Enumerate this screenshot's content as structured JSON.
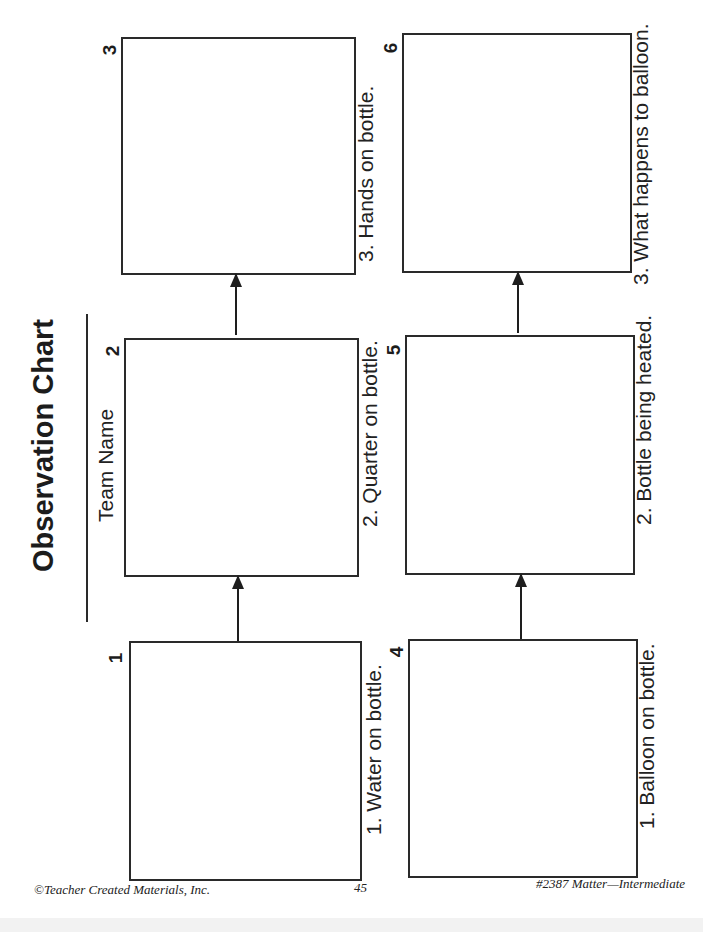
{
  "header": {
    "title": "Observation Chart",
    "team_label": "Team Name"
  },
  "panels": [
    {
      "number": "1",
      "caption": "1.  Water on bottle."
    },
    {
      "number": "2",
      "caption": "2.  Quarter on bottle."
    },
    {
      "number": "3",
      "caption": "3.  Hands on bottle."
    },
    {
      "number": "4",
      "caption": "1.  Balloon on bottle."
    },
    {
      "number": "5",
      "caption": "2.  Bottle being heated."
    },
    {
      "number": "6",
      "caption": "3.  What happens to balloon."
    }
  ],
  "footer": {
    "copyright": "©Teacher Created Materials, Inc.",
    "page_number": "45",
    "book_id": "#2387 Matter—Intermediate"
  }
}
